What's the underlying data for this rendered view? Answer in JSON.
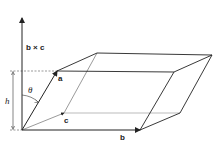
{
  "diagram": {
    "labels": {
      "cross": "b × c",
      "a": "a",
      "b": "b",
      "c": "c",
      "theta": "θ",
      "h": "h"
    },
    "colors": {
      "stroke": "#222222",
      "hidden": "#555555",
      "background": "#ffffff"
    }
  }
}
